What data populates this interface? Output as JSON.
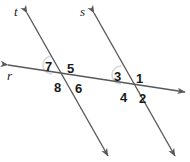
{
  "figure": {
    "type": "geometry-diagram",
    "width": 190,
    "height": 162,
    "background_color": "#ffffff",
    "line_color": "#58585a",
    "arc_color": "#d9d9dd",
    "text_color": "#1a1a1a"
  },
  "lines": [
    {
      "id": "t",
      "label": "t",
      "role": "transversal-left",
      "x1": 27,
      "y1": 13,
      "x2": 108,
      "y2": 156
    },
    {
      "id": "s",
      "label": "s",
      "role": "transversal-right",
      "x1": 94,
      "y1": 13,
      "x2": 175,
      "y2": 156
    },
    {
      "id": "r",
      "label": "r",
      "role": "horizontal-line",
      "x1": 8,
      "y1": 65,
      "x2": 185,
      "y2": 92
    }
  ],
  "intersections": [
    {
      "id": "left",
      "line_a": "t",
      "line_b": "r",
      "x": 62,
      "y": 73
    },
    {
      "id": "right",
      "line_a": "s",
      "line_b": "r",
      "x": 131,
      "y": 83
    }
  ],
  "angle_labels": [
    {
      "number": "1",
      "x": 136,
      "y": 72,
      "intersection": "right",
      "quadrant": "upper-right"
    },
    {
      "number": "2",
      "x": 139,
      "y": 92,
      "intersection": "right",
      "quadrant": "lower-right"
    },
    {
      "number": "3",
      "x": 114,
      "y": 70,
      "intersection": "right",
      "quadrant": "upper-left",
      "has_arc": true
    },
    {
      "number": "4",
      "x": 120,
      "y": 91,
      "intersection": "right",
      "quadrant": "lower-left"
    },
    {
      "number": "5",
      "x": 67,
      "y": 62,
      "intersection": "left",
      "quadrant": "upper-right"
    },
    {
      "number": "6",
      "x": 75,
      "y": 82,
      "intersection": "left",
      "quadrant": "lower-right"
    },
    {
      "number": "7",
      "x": 45,
      "y": 60,
      "intersection": "left",
      "quadrant": "upper-left",
      "has_arc": true
    },
    {
      "number": "8",
      "x": 54,
      "y": 81,
      "intersection": "left",
      "quadrant": "lower-left"
    }
  ],
  "line_label_positions": [
    {
      "id": "t",
      "label": "t",
      "x": 14,
      "y": 5
    },
    {
      "id": "s",
      "label": "s",
      "x": 80,
      "y": 5
    },
    {
      "id": "r",
      "label": "r",
      "x": 7,
      "y": 69
    }
  ],
  "arcs": [
    {
      "at": "left",
      "for_angle": "7",
      "cx": 52,
      "cy": 65,
      "r": 9
    },
    {
      "at": "right",
      "for_angle": "3",
      "cx": 121,
      "cy": 75,
      "r": 9
    }
  ],
  "arrowheads": [
    {
      "line": "t",
      "end": "top",
      "x": 27,
      "y": 13
    },
    {
      "line": "t",
      "end": "bottom",
      "x": 108,
      "y": 156
    },
    {
      "line": "s",
      "end": "top",
      "x": 94,
      "y": 13
    },
    {
      "line": "s",
      "end": "bottom",
      "x": 175,
      "y": 156
    },
    {
      "line": "r",
      "end": "left",
      "x": 8,
      "y": 65
    },
    {
      "line": "r",
      "end": "right",
      "x": 185,
      "y": 92
    }
  ]
}
